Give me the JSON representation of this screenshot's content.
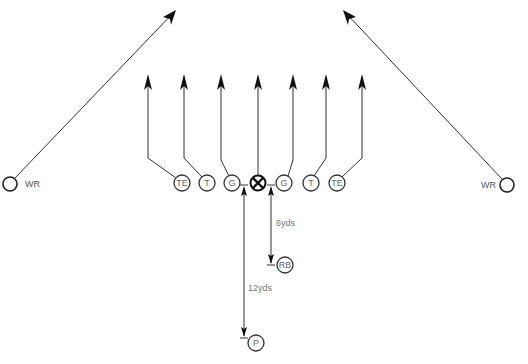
{
  "diagram": {
    "type": "football-play",
    "players": [
      {
        "id": "wr_left",
        "label": "WR",
        "x": 10,
        "y": 184
      },
      {
        "id": "te_left",
        "label": "TE",
        "x": 182,
        "y": 183
      },
      {
        "id": "t_left",
        "label": "T",
        "x": 207,
        "y": 183
      },
      {
        "id": "g_left",
        "label": "G",
        "x": 232,
        "y": 183
      },
      {
        "id": "center",
        "label": "",
        "x": 258,
        "y": 183
      },
      {
        "id": "g_right",
        "label": "G",
        "x": 284,
        "y": 183
      },
      {
        "id": "t_right",
        "label": "T",
        "x": 311,
        "y": 183
      },
      {
        "id": "te_right",
        "label": "TE",
        "x": 337,
        "y": 183
      },
      {
        "id": "wr_right",
        "label": "WR",
        "x": 507,
        "y": 185
      },
      {
        "id": "rb",
        "label": "RB",
        "x": 284,
        "y": 265
      },
      {
        "id": "p",
        "label": "P",
        "x": 256,
        "y": 343
      }
    ],
    "labels": {
      "wr_left": "WR",
      "wr_right": "WR",
      "te_left": "TE",
      "t_left": "T",
      "g_left": "G",
      "g_right": "G",
      "t_right": "T",
      "te_right": "TE",
      "rb": "RB",
      "p": "P"
    },
    "dimensions": {
      "rb_depth": "6yds",
      "p_depth": "12yds"
    },
    "colors": {
      "line": "#222222",
      "circle_stroke": "#333333",
      "text": "#666666"
    }
  }
}
